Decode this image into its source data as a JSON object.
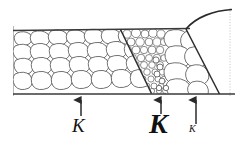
{
  "figure": {
    "background_color": "#ffffff",
    "stroke_color": "#3a3a3a",
    "label_color": "#111111",
    "width": 242,
    "height": 150
  },
  "boundaries": {
    "top_rule": {
      "x1": 13,
      "y1": 30,
      "x2": 190,
      "y2": 28
    },
    "bottom_rule": {
      "x1": 13,
      "y1": 94,
      "x2": 235,
      "y2": 94
    },
    "left_edge": {
      "x1": 13,
      "y1": 27,
      "x2": 13,
      "y2": 96
    },
    "right_edge_dotted": {
      "x1": 230,
      "y1": 8,
      "x2": 230,
      "y2": 96
    },
    "diagonal_1": {
      "x1": 120,
      "y1": 30,
      "x2": 151,
      "y2": 93
    },
    "diagonal_2": {
      "x1": 186,
      "y1": 29,
      "x2": 219,
      "y2": 94
    },
    "curve": {
      "from_x": 186,
      "from_y": 29,
      "to_x": 230,
      "to_y": 10
    }
  },
  "zones": [
    {
      "name": "coarse-left-zone",
      "grain": "coarse",
      "x_range": [
        13,
        124
      ],
      "description": "Large equiaxed rounded grains"
    },
    {
      "name": "fine-middle-zone",
      "grain": "fine",
      "x_range": [
        124,
        166
      ],
      "description": "Fine densely packed grains"
    },
    {
      "name": "coarse-right-zone",
      "grain": "coarse",
      "x_range": [
        166,
        219
      ],
      "description": "Large grains near free surface"
    }
  ],
  "annotations": [
    {
      "id": "k1",
      "label": "K",
      "style": "italic",
      "size": "medium",
      "arrow_x": 81,
      "arrow_tip_y": 99,
      "arrow_tail_y": 116
    },
    {
      "id": "k2",
      "label": "K",
      "style": "italic-bold",
      "size": "large",
      "arrow_x": 161,
      "arrow_tip_y": 99,
      "arrow_tail_y": 114
    },
    {
      "id": "k3",
      "label": "K",
      "style": "italic",
      "size": "small",
      "arrow_x": 196,
      "arrow_tip_y": 99,
      "arrow_tail_y": 124
    }
  ]
}
